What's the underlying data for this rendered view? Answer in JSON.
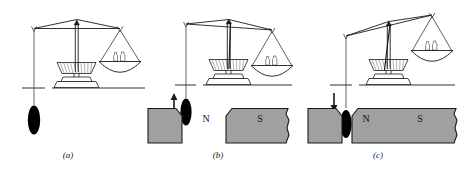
{
  "figure": {
    "background_color": "#ffffff",
    "ink_color": "#1a1a1a",
    "magnet_fill_color": "#a0a0a0",
    "magnet_stroke_color": "#1a1a1a",
    "sample_color": "#000000",
    "width": 466,
    "height": 171
  },
  "panels": [
    {
      "id": "a",
      "caption": "(a)",
      "balance_state": "level",
      "beam_tilt_degrees": 0,
      "magnets_present": false,
      "force_arrow": "none",
      "arrow_label": "",
      "weights_count": 2,
      "sample_label": "",
      "description": "Sample hangs freely, no magnetic field applied, balance is level"
    },
    {
      "id": "b",
      "caption": "(b)",
      "balance_state": "tilted-right-down",
      "beam_tilt_degrees": 4,
      "magnets_present": true,
      "force_arrow": "up",
      "arrow_label": "",
      "weights_count": 2,
      "pole_left": "N",
      "pole_right": "S",
      "description": "Sample above magnet gap experiences upward force, pan side dips"
    },
    {
      "id": "c",
      "caption": "(c)",
      "balance_state": "tilted-right-up",
      "beam_tilt_degrees": -12,
      "magnets_present": true,
      "force_arrow": "down",
      "arrow_label": "",
      "weights_count": 2,
      "pole_left": "N",
      "pole_right": "S",
      "description": "Sample drawn down into magnet gap, pan side rises"
    }
  ],
  "legend": {
    "north_pole": "N",
    "south_pole": "S"
  }
}
